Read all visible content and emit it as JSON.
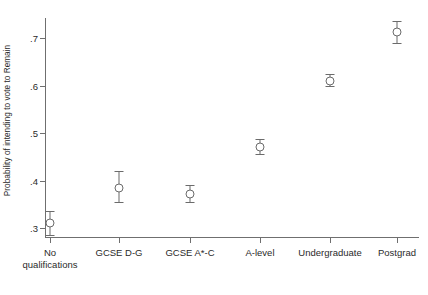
{
  "chart_data": {
    "type": "scatter",
    "title": "",
    "subtitle": "",
    "xlabel": "",
    "ylabel": "Probability of intending to vote to Remain",
    "categories": [
      "No\nqualifications",
      "GCSE D-G",
      "GCSE A*-C",
      "A-level",
      "Undergraduate",
      "Postgrad"
    ],
    "values": [
      0.31,
      0.385,
      0.372,
      0.47,
      0.61,
      0.712
    ],
    "ci_low": [
      0.285,
      0.355,
      0.355,
      0.455,
      0.598,
      0.69
    ],
    "ci_high": [
      0.335,
      0.42,
      0.39,
      0.487,
      0.625,
      0.735
    ],
    "ylim": [
      0.27,
      0.745
    ],
    "y_ticks": [
      0.3,
      0.4,
      0.5,
      0.6,
      0.7
    ],
    "y_tick_labels": [
      ".3",
      ".4",
      ".5",
      ".6",
      ".7"
    ],
    "grid": false,
    "legend": "none",
    "marker": "open-circle",
    "series_name": "Probability of intending to vote to Remain",
    "marker_color": "#6b6b6b",
    "axis_color": "#6f6f6f"
  }
}
